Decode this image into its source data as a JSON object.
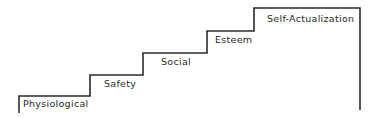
{
  "diagram": {
    "type": "staircase",
    "title": "",
    "line_color": "#2b2b2b",
    "steps": [
      {
        "label": "Physiological"
      },
      {
        "label": "Safety"
      },
      {
        "label": "Social"
      },
      {
        "label": "Esteem"
      },
      {
        "label": "Self-Actualization"
      }
    ]
  }
}
